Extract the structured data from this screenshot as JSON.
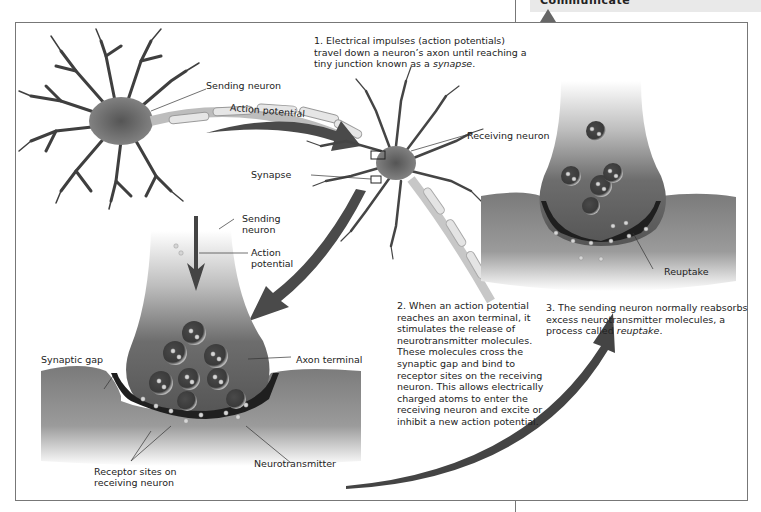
{
  "header": {
    "section_title": "Communicate"
  },
  "figure": {
    "steps": [
      {
        "number": "1.",
        "text": "Electrical impulses (action potentials) travel down a neuron’s axon until reaching a tiny junction known as a",
        "italic_term": "synapse",
        "suffix": "."
      },
      {
        "number": "2.",
        "text": "When an action potential reaches an axon terminal, it stimulates the release of neurotransmitter molecules. These molecules cross the synaptic gap and bind to receptor sites on the receiving neuron. This allows electrically charged atoms to enter the receiving neuron and excite or inhibit a new action potential."
      },
      {
        "number": "3.",
        "text": "The sending neuron normally reabsorbs excess neurotransmitter molecules, a process called",
        "italic_term": "reuptake",
        "suffix": "."
      }
    ],
    "labels": {
      "sending_neuron_top": "Sending neuron",
      "action_potential_top": "Action potential",
      "receiving_neuron": "Receiving neuron",
      "synapse": "Synapse",
      "sending_neuron_mid_1": "Sending",
      "sending_neuron_mid_2": "neuron",
      "action_potential_mid_1": "Action",
      "action_potential_mid_2": "potential",
      "synaptic_gap": "Synaptic gap",
      "axon_terminal": "Axon terminal",
      "receptor_sites_1": "Receptor sites on",
      "receptor_sites_2": "receiving neuron",
      "neurotransmitter": "Neurotransmitter",
      "reuptake": "Reuptake"
    },
    "colors": {
      "neuron_dark": "#3a3a3a",
      "neuron_mid": "#6b6b6b",
      "arrow": "#4a4a4a",
      "frame_border": "#777777",
      "text": "#222222"
    }
  }
}
